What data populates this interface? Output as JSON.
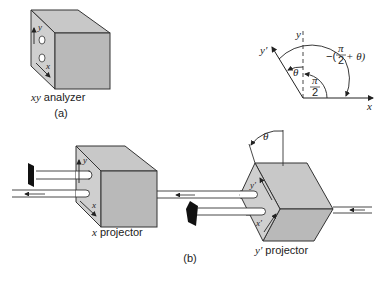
{
  "figure_a": {
    "caption": "(a)",
    "analyzer_label_var": "xy",
    "analyzer_label_text": " analyzer",
    "axis_y": "y",
    "axis_x": "x"
  },
  "angle_diagram": {
    "axis_y": "y",
    "axis_y_prime": "y′",
    "axis_x": "x",
    "theta": "θ",
    "half_pi_num": "π",
    "half_pi_den": "2",
    "neg_angle_prefix": "−(",
    "neg_angle_suffix": " + θ)"
  },
  "figure_b": {
    "caption": "(b)",
    "x_projector_var": "x",
    "x_projector_text": " projector",
    "y_projector_var": "y′",
    "y_projector_text": " projector",
    "x_proj_axis_y": "y",
    "x_proj_axis_x": "x",
    "y_proj_axis_y": "y′",
    "y_proj_axis_x": "x′",
    "theta": "θ"
  },
  "colors": {
    "cube_front": "#b9b9b9",
    "cube_top": "#c8c8c8",
    "cube_side": "#cfcfcf",
    "stroke": "#333333",
    "blocker": "#111111"
  }
}
